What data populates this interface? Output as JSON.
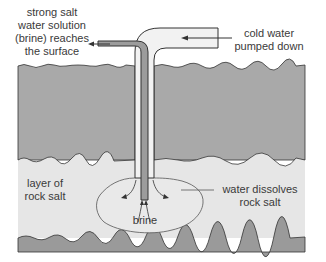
{
  "labels": {
    "brine_out": [
      "strong salt",
      "water solution",
      "(brine) reaches",
      "the surface"
    ],
    "water_in": [
      "cold water",
      "pumped down"
    ],
    "salt_layer": [
      "layer of",
      "rock salt"
    ],
    "dissolves": [
      "water dissolves",
      "rock salt"
    ],
    "brine": "brine"
  },
  "colors": {
    "rock_layer": "#a9a9a9",
    "salt_layer": "#e6e6e6",
    "bottom_layer": "#9a9a9a",
    "pipe_outer": "#f0f0f0",
    "pipe_inner": "#9c9c9c",
    "outline": "#333333",
    "text": "#3a3a3a"
  },
  "layers": [
    {
      "name": "overlying rock",
      "top": 65,
      "bottom": 160
    },
    {
      "name": "rock salt",
      "top": 160,
      "bottom": 238
    },
    {
      "name": "underlying rock",
      "top": 238,
      "bottom": 252
    }
  ]
}
